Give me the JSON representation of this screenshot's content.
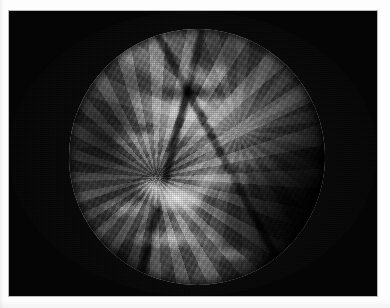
{
  "document": {
    "type": "scanned-page",
    "background_color": "#fdfdfd",
    "width": 390,
    "height": 308
  },
  "figure": {
    "name": "earth-full-disk-satellite-image",
    "caption": "",
    "frame": {
      "x": 9,
      "y": 11,
      "width": 368,
      "height": 285,
      "background_color": "#050505",
      "border_color": "#b9b9b9",
      "label": "Space background"
    },
    "subject": {
      "label": "Earth",
      "view": "full disk",
      "imagery": "grayscale visible-band geostationary satellite",
      "centered_on": "Africa",
      "center_x": 197,
      "center_y": 157,
      "radius": 128,
      "colors": {
        "space": "#050505",
        "disk_bright": "#e8e8e8",
        "disk_mid": "#8e8e8e",
        "disk_dark": "#2a2a2a",
        "cloud_highlight": "#ffffff"
      }
    },
    "features": [
      {
        "name": "sahara-desert",
        "tone": "bright",
        "note": "large high-albedo landmass, upper-left of disk"
      },
      {
        "name": "mediterranean-sea",
        "tone": "dark",
        "note": "dark band above the Sahara"
      },
      {
        "name": "arabian-peninsula",
        "tone": "bright",
        "note": "upper-right of disk"
      },
      {
        "name": "red-sea-rift",
        "tone": "dark",
        "note": "narrow dark diagonal line"
      },
      {
        "name": "atlantic-ocean",
        "tone": "dark",
        "note": "left limb"
      },
      {
        "name": "indian-ocean",
        "tone": "dark",
        "note": "lower-right limb"
      },
      {
        "name": "itcz-cloud-band",
        "tone": "bright",
        "note": "equatorial convective cloud band"
      },
      {
        "name": "congo-convective-cluster",
        "tone": "brightest",
        "note": "brightest cloud cluster, lower-centre"
      },
      {
        "name": "terminator",
        "tone": "shadow",
        "note": "day/night boundary darkening the right limb"
      }
    ]
  }
}
